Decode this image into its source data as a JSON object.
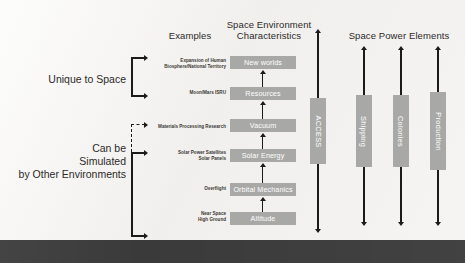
{
  "headers": {
    "examples": "Examples",
    "characteristics_line1": "Space Environment",
    "characteristics_line2": "Characteristics",
    "power_elements": "Space Power Elements"
  },
  "groups": {
    "unique": "Unique to Space",
    "simulated_line1": "Can be",
    "simulated_line2": "Simulated",
    "simulated_line3": "by Other Environments"
  },
  "rows": [
    {
      "example_line1": "Expansion of Human",
      "example_line2": "Biosphere/National Territory",
      "characteristic": "New worlds"
    },
    {
      "example_line1": "Moon/Mars ISRU",
      "example_line2": "",
      "characteristic": "Resources"
    },
    {
      "example_line1": "Materials Processing Research",
      "example_line2": "",
      "characteristic": "Vacuum"
    },
    {
      "example_line1": "Solar Power Satellites",
      "example_line2": "Solar Panels",
      "characteristic": "Solar Energy"
    },
    {
      "example_line1": "Overflight",
      "example_line2": "",
      "characteristic": "Orbital Mechanics"
    },
    {
      "example_line1": "Near Space",
      "example_line2": "High Ground",
      "characteristic": "Altitude"
    }
  ],
  "access_bar": {
    "label": "ACCESS"
  },
  "power_bars": [
    {
      "label": "Shipping"
    },
    {
      "label": "Colonies"
    },
    {
      "label": "Production"
    }
  ],
  "colors": {
    "box_fill": "#a8a8a6",
    "box_text": "#ffffff",
    "arrow": "#1c1b1a",
    "background": "#f2f1ef",
    "bottom_bar": "#3a3a3a",
    "heading_text": "#2c2a28"
  }
}
